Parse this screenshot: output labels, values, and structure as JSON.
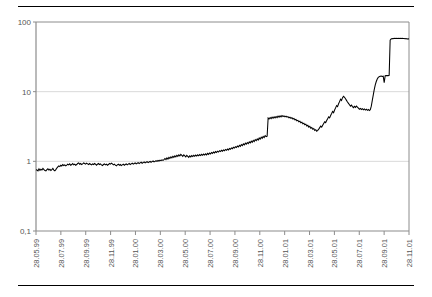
{
  "page": {
    "background_color": "#ffffff"
  },
  "rules": {
    "top_label": "top-horizontal-rule",
    "bottom_label": "bottom-horizontal-rule",
    "color": "#000000"
  },
  "chart_data": {
    "type": "line",
    "title": "",
    "subtitle": "",
    "xlabel": "",
    "ylabel": "",
    "yscale": "log",
    "ylim": [
      0.1,
      100
    ],
    "grid": true,
    "legend": false,
    "legend_position": "none",
    "line_color": "#000000",
    "grid_color": "#d9d9d9",
    "axis_color": "#808080",
    "ytick_labels": [
      "100",
      "10",
      "1",
      "0,1"
    ],
    "ytick_values": [
      100,
      10,
      1,
      0.1
    ],
    "xtick_labels": [
      "28.05.99",
      "28.07.99",
      "28.09.99",
      "28.11.99",
      "28.01.00",
      "28.03.00",
      "28.05.00",
      "28.07.00",
      "28.09.00",
      "28.11.00",
      "28.01.01",
      "28.03.01",
      "28.05.01",
      "28.07.01",
      "28.09.01",
      "28.11.01"
    ],
    "x_start_label": "28.05.99",
    "x_end_label": "28.11.01",
    "series": [
      {
        "name": "value",
        "values": [
          0.76,
          0.75,
          0.73,
          0.78,
          0.74,
          0.77,
          0.75,
          0.79,
          0.76,
          0.74,
          0.73,
          0.76,
          0.78,
          0.75,
          0.77,
          0.74,
          0.76,
          0.79,
          0.75,
          0.73,
          0.76,
          0.8,
          0.83,
          0.86,
          0.84,
          0.88,
          0.86,
          0.9,
          0.87,
          0.89,
          0.86,
          0.88,
          0.91,
          0.89,
          0.92,
          0.88,
          0.9,
          0.93,
          0.89,
          0.91,
          0.88,
          0.9,
          0.93,
          0.95,
          0.91,
          0.93,
          0.9,
          0.92,
          0.95,
          0.93,
          0.91,
          0.94,
          0.92,
          0.9,
          0.93,
          0.91,
          0.89,
          0.92,
          0.9,
          0.93,
          0.91,
          0.88,
          0.91,
          0.93,
          0.9,
          0.92,
          0.89,
          0.87,
          0.9,
          0.92,
          0.89,
          0.91,
          0.88,
          0.9,
          0.93,
          0.91,
          0.94,
          0.92,
          0.89,
          0.91,
          0.88,
          0.86,
          0.89,
          0.91,
          0.88,
          0.9,
          0.87,
          0.89,
          0.91,
          0.88,
          0.9,
          0.92,
          0.89,
          0.91,
          0.93,
          0.9,
          0.92,
          0.94,
          0.91,
          0.93,
          0.95,
          0.92,
          0.94,
          0.96,
          0.93,
          0.95,
          0.97,
          0.94,
          0.96,
          0.98,
          0.95,
          0.97,
          0.99,
          0.96,
          0.98,
          1.0,
          0.97,
          0.99,
          1.01,
          0.98,
          1.0,
          1.02,
          1.0,
          1.03,
          1.01,
          1.04,
          1.02,
          1.05,
          1.03,
          1.06,
          1.1,
          1.06,
          1.12,
          1.08,
          1.14,
          1.1,
          1.16,
          1.12,
          1.18,
          1.14,
          1.2,
          1.16,
          1.22,
          1.18,
          1.24,
          1.2,
          1.26,
          1.22,
          1.18,
          1.24,
          1.2,
          1.16,
          1.22,
          1.18,
          1.14,
          1.2,
          1.16,
          1.21,
          1.17,
          1.22,
          1.18,
          1.23,
          1.19,
          1.24,
          1.2,
          1.25,
          1.21,
          1.26,
          1.22,
          1.27,
          1.23,
          1.28,
          1.24,
          1.3,
          1.26,
          1.32,
          1.28,
          1.34,
          1.3,
          1.36,
          1.32,
          1.38,
          1.34,
          1.4,
          1.36,
          1.42,
          1.38,
          1.44,
          1.4,
          1.46,
          1.42,
          1.48,
          1.44,
          1.5,
          1.46,
          1.53,
          1.49,
          1.56,
          1.52,
          1.59,
          1.55,
          1.62,
          1.58,
          1.66,
          1.61,
          1.7,
          1.64,
          1.74,
          1.68,
          1.78,
          1.72,
          1.82,
          1.76,
          1.86,
          1.8,
          1.9,
          1.84,
          1.95,
          1.88,
          2.0,
          1.92,
          2.05,
          1.98,
          2.1,
          2.02,
          2.16,
          2.08,
          2.22,
          2.14,
          2.28,
          2.2,
          2.34,
          2.26,
          2.3,
          4.2,
          4.05,
          4.25,
          4.1,
          4.3,
          4.15,
          4.35,
          4.2,
          4.4,
          4.25,
          4.45,
          4.3,
          4.5,
          4.35,
          4.55,
          4.4,
          4.5,
          4.35,
          4.45,
          4.3,
          4.38,
          4.22,
          4.3,
          4.15,
          4.22,
          4.05,
          4.12,
          3.95,
          4.0,
          3.82,
          3.88,
          3.7,
          3.76,
          3.58,
          3.64,
          3.45,
          3.52,
          3.35,
          3.42,
          3.22,
          3.3,
          3.1,
          3.18,
          2.98,
          3.05,
          2.88,
          2.95,
          2.78,
          2.85,
          2.7,
          2.78,
          2.9,
          3.05,
          3.2,
          3.1,
          3.3,
          3.5,
          3.7,
          3.6,
          3.85,
          4.1,
          4.35,
          4.2,
          4.55,
          4.85,
          5.2,
          5.0,
          5.45,
          5.85,
          6.3,
          6.1,
          6.7,
          7.2,
          7.8,
          7.5,
          8.2,
          8.6,
          8.3,
          7.9,
          7.5,
          7.1,
          6.8,
          6.5,
          6.2,
          6.4,
          6.1,
          5.9,
          6.15,
          5.95,
          6.2,
          6.0,
          5.8,
          5.6,
          5.75,
          5.55,
          5.7,
          5.5,
          5.65,
          5.45,
          5.6,
          5.4,
          5.55,
          5.35,
          5.5,
          6.2,
          7.5,
          9.0,
          10.8,
          12.5,
          14.0,
          15.2,
          16.0,
          16.4,
          16.6,
          16.8,
          16.5,
          16.7,
          13.5,
          16.9,
          17.0,
          17.1,
          17.0,
          17.2,
          55.0,
          57.0,
          58.0,
          57.5,
          58.5,
          58.0,
          58.5,
          58.0,
          58.2,
          58.0,
          58.3,
          58.0,
          58.2,
          57.8,
          58.0,
          57.5,
          57.8,
          57.2,
          57.5,
          57.0
        ]
      }
    ],
    "annotations": [
      {
        "label": "plateau-start-level",
        "value": 0.76
      },
      {
        "label": "step-jump-2001-03",
        "value": 4.2
      },
      {
        "label": "local-peak",
        "value": 8.6
      },
      {
        "label": "intermediate-plateau",
        "value": 17.0
      },
      {
        "label": "final-plateau",
        "value": 58.0
      }
    ]
  }
}
